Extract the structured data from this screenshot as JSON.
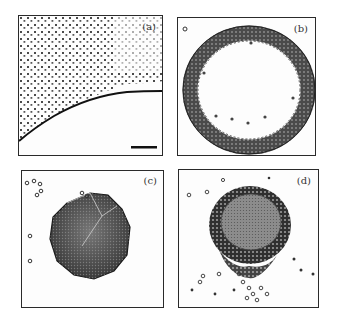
{
  "figure": {
    "panels": [
      {
        "id": "a",
        "label": "(a)",
        "description": "Particle field above a curved interface with scale bar"
      },
      {
        "id": "b",
        "label": "(b)",
        "description": "Ring-shaped aggregate of particles"
      },
      {
        "id": "c",
        "label": "(c)",
        "description": "Compact polygonal cluster with few free particles"
      },
      {
        "id": "d",
        "label": "(d)",
        "description": "Round cluster with particle shell and trailing particles"
      }
    ],
    "colors": {
      "border": "#2a2a2a",
      "particle": "#333333",
      "cluster_fill": "#555555",
      "background": "#fdfdfd"
    }
  }
}
